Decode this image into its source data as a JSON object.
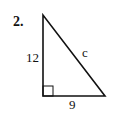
{
  "problem": {
    "number": "2.",
    "shape": "right-triangle",
    "labels": {
      "vertical_leg": "12",
      "horizontal_leg": "9",
      "hypotenuse": "c"
    },
    "right_angle_marker": true,
    "stroke_color": "#111111",
    "background": "#ffffff"
  }
}
